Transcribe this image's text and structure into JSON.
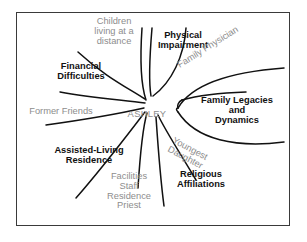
{
  "diagram": {
    "type": "eco-map",
    "title_visible": false,
    "center": {
      "label": "ASHLEY",
      "color": "#8d8d8d"
    },
    "frame": {
      "border_color": "#3a3a3a",
      "background": "#ffffff"
    },
    "colors": {
      "primary_text": "#111111",
      "secondary_text": "#8d8d8d",
      "stroke": "#111111"
    },
    "nodes": [
      {
        "id": "children-distance",
        "label": "Children\nliving at a\ndistance",
        "style": "secondary",
        "align": "center",
        "position": "top-left"
      },
      {
        "id": "physical-impairment",
        "label": "Physical\nImpairment",
        "style": "primary",
        "align": "center",
        "position": "top"
      },
      {
        "id": "financial-difficulties",
        "label": "Financial\nDifficulties",
        "style": "primary",
        "align": "center",
        "position": "upper-left"
      },
      {
        "id": "family-physician",
        "label": "Family Physician",
        "style": "secondary",
        "align": "left",
        "position": "upper-right",
        "rotation": -32
      },
      {
        "id": "family-legacies",
        "label": "Family Legacies\nand\nDynamics",
        "style": "primary",
        "align": "center",
        "position": "right"
      },
      {
        "id": "former-friends",
        "label": "Former Friends",
        "style": "secondary",
        "align": "center",
        "position": "left"
      },
      {
        "id": "youngest-daughter",
        "label": "Youngest\nDaughter",
        "style": "secondary",
        "align": "left",
        "position": "lower-right",
        "rotation": 28
      },
      {
        "id": "assisted-living",
        "label": "Assisted-Living\nResidence",
        "style": "primary",
        "align": "center",
        "position": "lower-left"
      },
      {
        "id": "religious-affiliations",
        "label": "Religious\nAffiliations",
        "style": "primary",
        "align": "center",
        "position": "bottom-right"
      },
      {
        "id": "facilities-staff",
        "label": "Facilities\nStaff\nResidence\nPriest",
        "style": "secondary",
        "align": "center",
        "position": "bottom"
      }
    ]
  }
}
